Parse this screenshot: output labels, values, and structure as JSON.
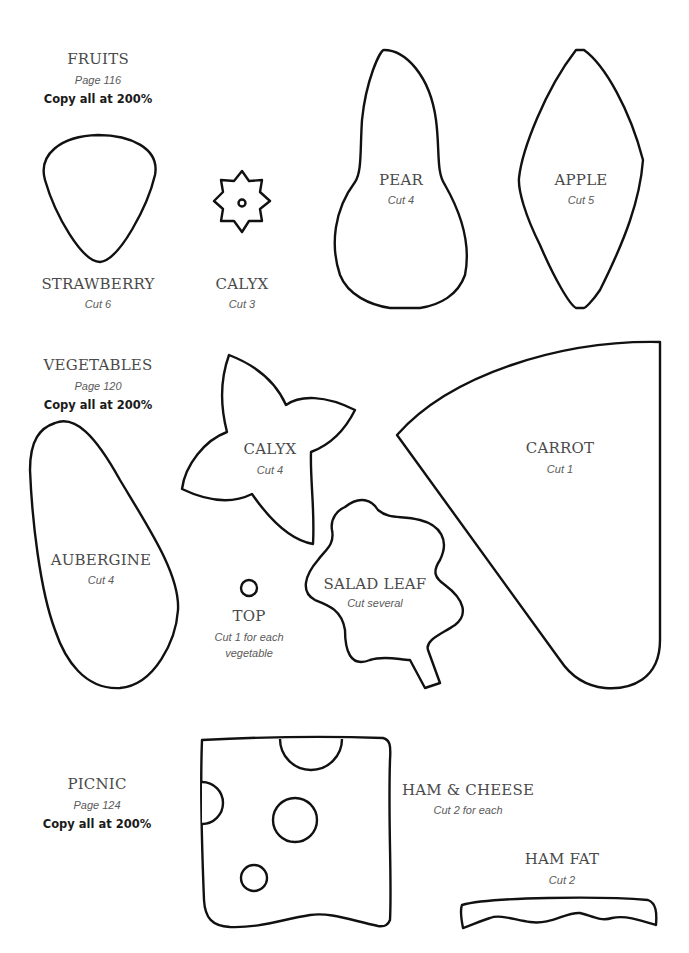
{
  "sections": {
    "fruits": {
      "title": "FRUITS",
      "page": "Page 116",
      "instruction": "Copy all at 200%"
    },
    "vegetables": {
      "title": "VEGETABLES",
      "page": "Page 120",
      "instruction": "Copy all at 200%"
    },
    "picnic": {
      "title": "PICNIC",
      "page": "Page 124",
      "instruction": "Copy all at 200%"
    }
  },
  "templates": {
    "strawberry": {
      "name": "STRAWBERRY",
      "cut": "Cut 6"
    },
    "fruit_calyx": {
      "name": "CALYX",
      "cut": "Cut 3"
    },
    "pear": {
      "name": "PEAR",
      "cut": "Cut 4"
    },
    "apple": {
      "name": "APPLE",
      "cut": "Cut 5"
    },
    "veg_calyx": {
      "name": "CALYX",
      "cut": "Cut 4"
    },
    "carrot": {
      "name": "CARROT",
      "cut": "Cut 1"
    },
    "aubergine": {
      "name": "AUBERGINE",
      "cut": "Cut 4"
    },
    "top": {
      "name": "TOP",
      "cut_line1": "Cut 1 for each",
      "cut_line2": "vegetable"
    },
    "salad_leaf": {
      "name": "SALAD LEAF",
      "cut": "Cut several"
    },
    "ham_cheese": {
      "name": "HAM & CHEESE",
      "cut": "Cut 2 for each"
    },
    "ham_fat": {
      "name": "HAM FAT",
      "cut": "Cut 2"
    }
  },
  "colors": {
    "outline": "#111111",
    "title_text": "#4a4a4a",
    "instruction_text": "#1a1a1a",
    "background": "#ffffff"
  }
}
